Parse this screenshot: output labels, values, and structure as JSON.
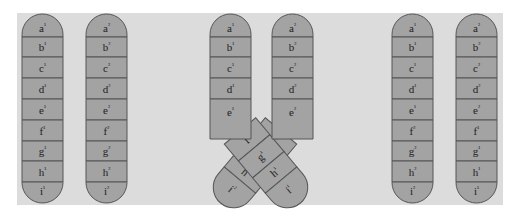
{
  "figure": {
    "panels": [
      {
        "name": "before-crossing-over",
        "chromosomes": [
          {
            "name": "chromosome-1",
            "segments": [
              "a¹",
              "b¹",
              "c¹",
              "d¹",
              "e¹",
              "f¹",
              "g¹",
              "h¹",
              "i¹"
            ]
          },
          {
            "name": "chromosome-2",
            "segments": [
              "a²",
              "b²",
              "c²",
              "d²",
              "e²",
              "f²",
              "g²",
              "h²",
              "i²"
            ]
          }
        ]
      },
      {
        "name": "crossing-over",
        "chromosomes": [
          {
            "name": "chromosome-1",
            "upper_segments": [
              "a¹",
              "b¹",
              "c¹",
              "d¹",
              "e¹"
            ],
            "crossed_segments": [
              "f¹",
              "g¹",
              "h¹",
              "i¹"
            ]
          },
          {
            "name": "chromosome-2",
            "upper_segments": [
              "a²",
              "b²",
              "c²",
              "d²",
              "e²"
            ],
            "crossed_segments": [
              "f²",
              "g²",
              "h²",
              "i²"
            ]
          }
        ]
      },
      {
        "name": "after-crossing-over",
        "chromosomes": [
          {
            "name": "recombinant-1",
            "segments": [
              "a¹",
              "b¹",
              "c¹",
              "d¹",
              "e¹",
              "f²",
              "g²",
              "h²",
              "i²"
            ]
          },
          {
            "name": "recombinant-2",
            "segments": [
              "a²",
              "b²",
              "c²",
              "d²",
              "e²",
              "f¹",
              "g¹",
              "h¹",
              "i¹"
            ]
          }
        ]
      }
    ],
    "colors": {
      "background": "#dcdcdc",
      "segment_fill": "#a3a3a3",
      "outline": "#555555",
      "text": "#222222"
    }
  }
}
